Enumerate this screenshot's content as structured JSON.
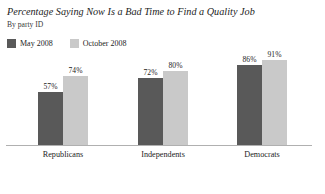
{
  "chart_data": {
    "type": "bar",
    "title": "Percentage Saying Now Is a Bad Time to Find a Quality Job",
    "subtitle": "By party ID",
    "xlabel": "",
    "ylabel": "",
    "ylim": [
      0,
      100
    ],
    "grid": false,
    "legend_position": "top-left",
    "categories": [
      "Republicans",
      "Independents",
      "Democrats"
    ],
    "series": [
      {
        "name": "May 2008",
        "color": "#595959",
        "values": [
          57,
          72,
          86
        ],
        "labels": [
          "57%",
          "72%",
          "86%"
        ]
      },
      {
        "name": "October 2008",
        "color": "#c9c9c9",
        "values": [
          74,
          80,
          91
        ],
        "labels": [
          "74%",
          "80%",
          "91%"
        ]
      }
    ]
  },
  "axis": {
    "baseline_color": "#b0b0b0"
  }
}
